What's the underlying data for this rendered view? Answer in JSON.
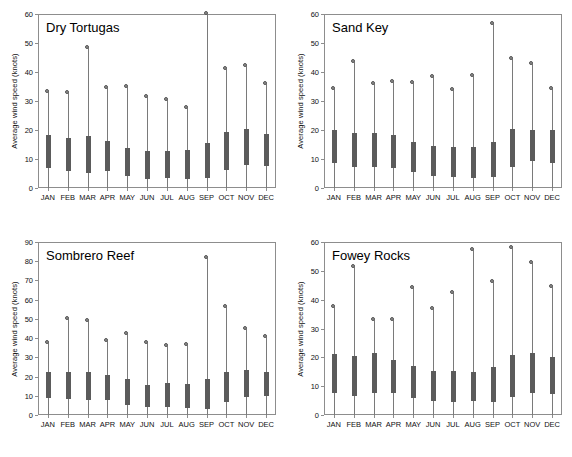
{
  "figure": {
    "background": "#ffffff",
    "bar_color": "#5b5b5b",
    "stem_color": "#7a7a7a",
    "axis_color": "#8d8d8d",
    "months": [
      "JAN",
      "FEB",
      "MAR",
      "APR",
      "MAY",
      "JUN",
      "JUL",
      "AUG",
      "SEP",
      "OCT",
      "NOV",
      "DEC"
    ],
    "ylabel": "Average wind speed (knots)"
  },
  "chart_data": [
    {
      "type": "bar",
      "title": "Dry Tortugas",
      "xlabel": "",
      "ylabel": "Average wind speed (knots)",
      "ylim": [
        0,
        60
      ],
      "yticks": [
        0,
        10,
        20,
        30,
        40,
        50,
        60
      ],
      "grid": false,
      "legend": "none",
      "categories": [
        "JAN",
        "FEB",
        "MAR",
        "APR",
        "MAY",
        "JUN",
        "JUL",
        "AUG",
        "SEP",
        "OCT",
        "NOV",
        "DEC"
      ],
      "series": [
        {
          "name": "box_low",
          "values": [
            6.8,
            6.0,
            5.0,
            5.8,
            4.1,
            3.2,
            3.4,
            3.1,
            3.5,
            6.2,
            8.0,
            7.6
          ]
        },
        {
          "name": "box_high",
          "values": [
            18.4,
            17.4,
            17.9,
            16.3,
            13.9,
            12.9,
            12.8,
            13.1,
            15.4,
            19.2,
            20.2,
            18.7
          ]
        },
        {
          "name": "max",
          "values": [
            33.0,
            32.9,
            48.3,
            34.6,
            34.8,
            31.3,
            30.2,
            27.5,
            60.0,
            40.9,
            41.9,
            36.0
          ]
        }
      ]
    },
    {
      "type": "bar",
      "title": "Sand Key",
      "xlabel": "",
      "ylabel": "Average wind speed (knots)",
      "ylim": [
        0,
        60
      ],
      "yticks": [
        0,
        10,
        20,
        30,
        40,
        50,
        60
      ],
      "grid": false,
      "legend": "none",
      "categories": [
        "JAN",
        "FEB",
        "MAR",
        "APR",
        "MAY",
        "JUN",
        "JUL",
        "AUG",
        "SEP",
        "OCT",
        "NOV",
        "DEC"
      ],
      "series": [
        {
          "name": "box_low",
          "values": [
            8.6,
            7.2,
            7.2,
            6.9,
            5.5,
            4.1,
            3.9,
            3.3,
            3.9,
            7.1,
            9.4,
            8.6
          ]
        },
        {
          "name": "box_high",
          "values": [
            19.9,
            18.8,
            18.8,
            18.4,
            15.7,
            14.4,
            14.3,
            14.0,
            15.9,
            20.4,
            20.0,
            20.1
          ]
        },
        {
          "name": "max",
          "values": [
            34.2,
            43.4,
            35.9,
            36.4,
            36.3,
            38.4,
            33.8,
            38.7,
            56.5,
            44.6,
            42.7,
            34.3
          ]
        }
      ]
    },
    {
      "type": "bar",
      "title": "Sombrero Reef",
      "xlabel": "",
      "ylabel": "Average wind speed (knots)",
      "ylim": [
        0,
        90
      ],
      "yticks": [
        0,
        10,
        20,
        30,
        40,
        50,
        60,
        70,
        80,
        90
      ],
      "grid": false,
      "legend": "none",
      "categories": [
        "JAN",
        "FEB",
        "MAR",
        "APR",
        "MAY",
        "JUN",
        "JUL",
        "AUG",
        "SEP",
        "OCT",
        "NOV",
        "DEC"
      ],
      "series": [
        {
          "name": "box_low",
          "values": [
            8.8,
            8.2,
            7.9,
            7.6,
            5.1,
            4.2,
            3.9,
            3.8,
            3.3,
            6.7,
            9.1,
            9.7
          ]
        },
        {
          "name": "box_high",
          "values": [
            22.6,
            22.3,
            22.3,
            21.0,
            18.5,
            15.5,
            16.4,
            16.3,
            18.9,
            22.5,
            23.6,
            22.6
          ]
        },
        {
          "name": "max",
          "values": [
            37.4,
            50.1,
            48.8,
            38.6,
            41.9,
            37.2,
            35.8,
            36.4,
            81.9,
            56.1,
            44.7,
            40.6
          ]
        }
      ]
    },
    {
      "type": "bar",
      "title": "Fowey Rocks",
      "xlabel": "",
      "ylabel": "Average wind speed (knots)",
      "ylim": [
        0,
        60
      ],
      "yticks": [
        0,
        10,
        20,
        30,
        40,
        50,
        60
      ],
      "grid": false,
      "legend": "none",
      "categories": [
        "JAN",
        "FEB",
        "MAR",
        "APR",
        "MAY",
        "JUN",
        "JUL",
        "AUG",
        "SEP",
        "OCT",
        "NOV",
        "DEC"
      ],
      "series": [
        {
          "name": "box_low",
          "values": [
            7.6,
            6.6,
            7.7,
            7.5,
            6.0,
            4.7,
            4.6,
            4.9,
            4.5,
            6.4,
            7.7,
            7.4
          ]
        },
        {
          "name": "box_high",
          "values": [
            21.1,
            20.3,
            21.5,
            19.2,
            17.1,
            15.1,
            15.4,
            14.9,
            16.5,
            20.9,
            21.4,
            20.0
          ]
        },
        {
          "name": "max",
          "values": [
            37.5,
            51.4,
            32.8,
            32.8,
            44.1,
            36.7,
            42.3,
            57.1,
            46.3,
            57.8,
            52.7,
            44.5
          ]
        }
      ]
    }
  ]
}
